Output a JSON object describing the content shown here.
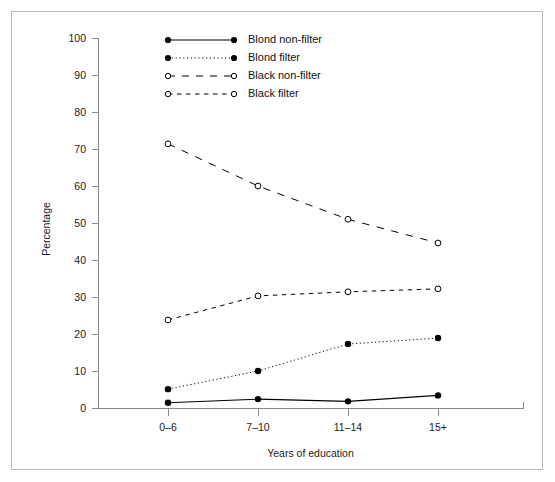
{
  "chart_data": {
    "type": "line",
    "title": "",
    "xlabel": "Years of education",
    "ylabel": "Percentage",
    "categories": [
      "0–6",
      "7–10",
      "11–14",
      "15+"
    ],
    "ylim": [
      0,
      100
    ],
    "yticks": [
      0,
      10,
      20,
      30,
      40,
      50,
      60,
      70,
      80,
      90,
      100
    ],
    "ytick_labels": [
      "0",
      "10",
      "20",
      "30",
      "40",
      "50",
      "60",
      "70",
      "80",
      "90",
      "100"
    ],
    "grid": false,
    "legend_position": "top-center-inside",
    "series": [
      {
        "name": "Blond non-filter",
        "values": [
          1.4,
          2.4,
          1.8,
          3.4
        ],
        "line_style": "solid",
        "marker": "filled-circle",
        "color": "#000000"
      },
      {
        "name": "Blond filter",
        "values": [
          5.1,
          10.0,
          17.3,
          18.9
        ],
        "line_style": "dotted",
        "marker": "filled-circle",
        "color": "#000000"
      },
      {
        "name": "Black non-filter",
        "values": [
          71.4,
          60.0,
          51.0,
          44.6
        ],
        "line_style": "long-dash",
        "marker": "open-circle",
        "color": "#000000"
      },
      {
        "name": "Black filter",
        "values": [
          23.8,
          30.3,
          31.4,
          32.2
        ],
        "line_style": "dash",
        "marker": "open-circle",
        "color": "#000000"
      }
    ]
  },
  "legend": {
    "items": [
      {
        "label": "Blond non-filter"
      },
      {
        "label": "Blond filter"
      },
      {
        "label": "Black non-filter"
      },
      {
        "label": "Black filter"
      }
    ]
  },
  "axes": {
    "y_title": "Percentage",
    "x_title": "Years of education"
  }
}
